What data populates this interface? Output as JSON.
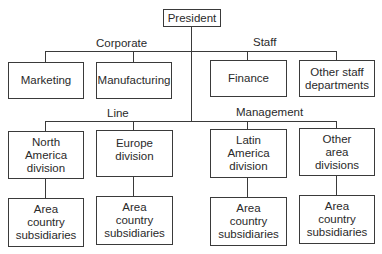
{
  "diagram": {
    "type": "organization-chart",
    "root": {
      "label": "President"
    },
    "group_labels": {
      "corporate": "Corporate",
      "staff": "Staff",
      "line": "Line",
      "management": "Management"
    },
    "staff_row": [
      {
        "label": "Marketing"
      },
      {
        "label": "Manufacturing"
      },
      {
        "label": "Finance"
      },
      {
        "label": "Other staff\ndepartments"
      }
    ],
    "division_row": [
      {
        "label": "North\nAmerica\ndivision"
      },
      {
        "label": "Europe\ndivision"
      },
      {
        "label": "Latin\nAmerica\ndivision"
      },
      {
        "label": "Other\narea\ndivisions"
      }
    ],
    "subsidiary_row": [
      {
        "label": "Area\ncountry\nsubsidiaries"
      },
      {
        "label": "Area\ncountry\nsubsidiaries"
      },
      {
        "label": "Area\ncountry\nsubsidiaries"
      },
      {
        "label": "Area\ncountry\nsubsidiaries"
      }
    ]
  }
}
